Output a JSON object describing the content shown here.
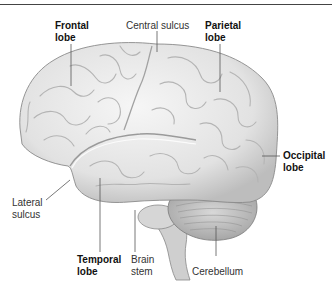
{
  "figure": {
    "labels": {
      "frontal_lobe": [
        "Frontal",
        "lobe"
      ],
      "central_sulcus": "Central sulcus",
      "parietal_lobe": [
        "Parietal",
        "lobe"
      ],
      "occipital_lobe": [
        "Occipital",
        "lobe"
      ],
      "lateral_sulcus": [
        "Lateral",
        "sulcus"
      ],
      "temporal_lobe": [
        "Temporal",
        "lobe"
      ],
      "brain_stem": [
        "Brain",
        "stem"
      ],
      "cerebellum": "Cerebellum"
    },
    "bold_labels": [
      "frontal_lobe",
      "parietal_lobe",
      "occipital_lobe",
      "temporal_lobe"
    ],
    "colors": {
      "cortex_fill": "#e9e9e9",
      "cortex_shadow": "#b8b8b8",
      "outline": "#8a8a8a",
      "leader_line": "#555555",
      "rule": "#444444"
    }
  }
}
